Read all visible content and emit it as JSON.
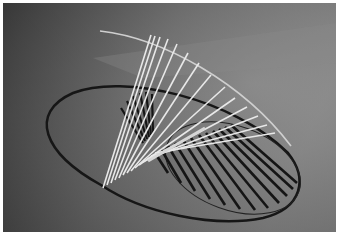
{
  "image": {
    "description": "Grayscale photograph of a ruled-surface rod sculpture casting an elliptical shadow on the floor",
    "colors": {
      "background_light": "#9a9a9a",
      "background_dark": "#2e2e2e",
      "rods": "#e6e6e6",
      "shadow": "#1a1a1a"
    }
  }
}
